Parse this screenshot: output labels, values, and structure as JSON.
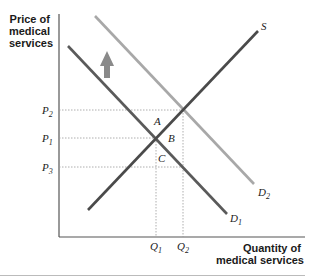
{
  "diagram": {
    "y_axis_title": [
      "Price of",
      "medical",
      "services"
    ],
    "x_axis_title": [
      "Quantity of",
      "medical services"
    ],
    "curves": {
      "supply": {
        "label": "S",
        "color": "#4a4a4a"
      },
      "demand1": {
        "label": "D",
        "sub": "1",
        "color": "#5a5a5a"
      },
      "demand2": {
        "label": "D",
        "sub": "2",
        "color": "#a8a8a8"
      }
    },
    "price_labels": [
      {
        "label": "P",
        "sub": "2"
      },
      {
        "label": "P",
        "sub": "1"
      },
      {
        "label": "P",
        "sub": "3"
      }
    ],
    "quantity_labels": [
      {
        "label": "Q",
        "sub": "1"
      },
      {
        "label": "Q",
        "sub": "2"
      }
    ],
    "points": [
      "A",
      "B",
      "C"
    ],
    "shift_arrow": {
      "direction": "up",
      "color": "#8a8a8a"
    }
  }
}
